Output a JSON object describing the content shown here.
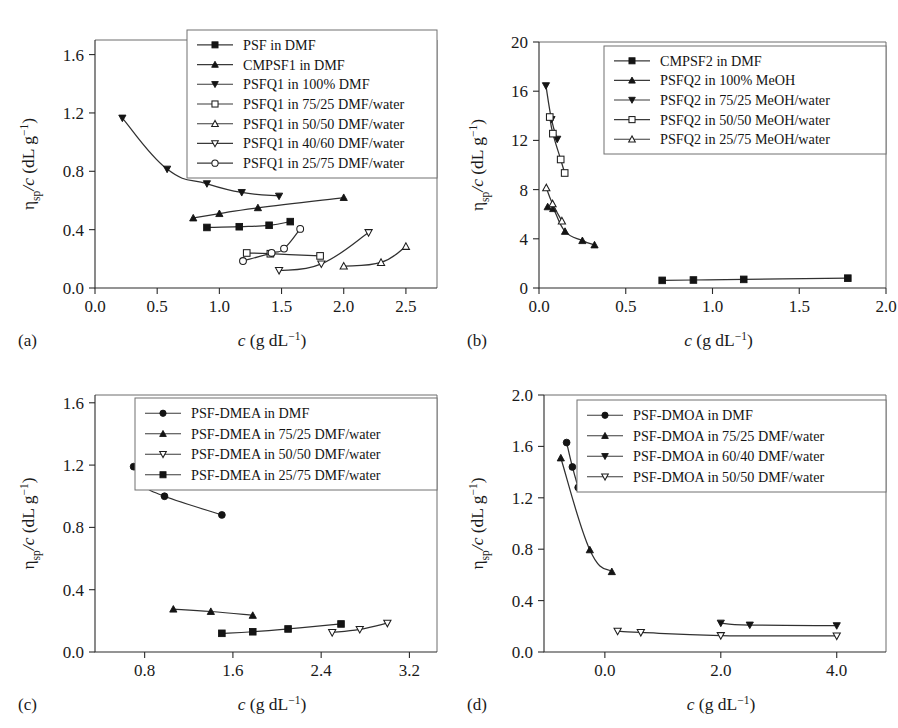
{
  "figure": {
    "panel_tags": [
      "(a)",
      "(b)",
      "(c)",
      "(d)"
    ],
    "axis_titles": {
      "x": "c (g dL−1)",
      "y": "ηsp/c (dL g−1)"
    },
    "x_symbol": "c",
    "x_units": "(g dL",
    "x_exp": "−1",
    "x_close": ")",
    "y_eta": "η",
    "y_sub": "sp",
    "y_slash_c": "/c",
    "y_units": "(dL g",
    "y_exp": "−1",
    "y_close": ")"
  },
  "chart_data": [
    {
      "id": "a",
      "type": "line",
      "panel_label": "(a)",
      "title": "",
      "xlabel": "c (g dL−1)",
      "ylabel": "ηsp/c (dL g−1)",
      "xlim": [
        0.0,
        2.75
      ],
      "ylim": [
        0.0,
        1.7
      ],
      "xticks": [
        0.0,
        0.5,
        1.0,
        1.5,
        2.0,
        2.5
      ],
      "xticklabels": [
        "0.0",
        "0.5",
        "1.0",
        "1.5",
        "2.0",
        "2.5"
      ],
      "yticks": [
        0.0,
        0.4,
        0.8,
        1.2,
        1.6
      ],
      "yticklabels": [
        "0.0",
        "0.4",
        "0.8",
        "1.2",
        "1.6"
      ],
      "grid": false,
      "legend_position": "top-right",
      "series": [
        {
          "name": "PSF in DMF",
          "marker": "square-filled",
          "x": [
            0.9,
            1.16,
            1.4,
            1.57
          ],
          "y": [
            0.415,
            0.42,
            0.43,
            0.455
          ]
        },
        {
          "name": "CMPSF1 in DMF",
          "marker": "triangle-up-filled",
          "x": [
            0.79,
            1.0,
            1.31,
            2.0
          ],
          "y": [
            0.48,
            0.51,
            0.55,
            0.62
          ]
        },
        {
          "name": "PSFQ1 in 100% DMF",
          "marker": "triangle-down-filled",
          "x": [
            0.22,
            0.58,
            0.9,
            1.18,
            1.48
          ],
          "y": [
            1.165,
            0.815,
            0.715,
            0.655,
            0.63
          ]
        },
        {
          "name": "PSFQ1 in 75/25 DMF/water",
          "marker": "square-open",
          "x": [
            1.22,
            1.41,
            1.81
          ],
          "y": [
            0.24,
            0.235,
            0.22
          ]
        },
        {
          "name": "PSFQ1 in 50/50 DMF/water",
          "marker": "triangle-up-open",
          "x": [
            2.0,
            2.3,
            2.5
          ],
          "y": [
            0.15,
            0.175,
            0.285
          ]
        },
        {
          "name": "PSFQ1 in 40/60 DMF/water",
          "marker": "triangle-down-open",
          "x": [
            1.48,
            1.82,
            2.2
          ],
          "y": [
            0.12,
            0.165,
            0.38
          ]
        },
        {
          "name": "PSFQ1 in 25/75 DMF/water",
          "marker": "circle-open",
          "x": [
            1.19,
            1.42,
            1.52,
            1.65
          ],
          "y": [
            0.185,
            0.24,
            0.27,
            0.405
          ]
        }
      ]
    },
    {
      "id": "b",
      "type": "line",
      "panel_label": "(b)",
      "title": "",
      "xlabel": "c (g dL−1)",
      "ylabel": "ηsp/c (dL g−1)",
      "xlim": [
        0.0,
        2.0
      ],
      "ylim": [
        0,
        20
      ],
      "xticks": [
        0.0,
        0.5,
        1.0,
        1.5,
        2.0
      ],
      "xticklabels": [
        "0.0",
        "0.5",
        "1.0",
        "1.5",
        "2.0"
      ],
      "yticks": [
        0,
        4,
        8,
        12,
        16,
        20
      ],
      "yticklabels": [
        "0",
        "4",
        "8",
        "12",
        "16",
        "20"
      ],
      "grid": false,
      "legend_position": "top-right",
      "series": [
        {
          "name": "CMPSF2 in DMF",
          "marker": "square-filled",
          "x": [
            0.71,
            0.89,
            1.18,
            1.78
          ],
          "y": [
            0.62,
            0.65,
            0.7,
            0.8
          ]
        },
        {
          "name": "PSFQ2 in 100% MeOH",
          "marker": "triangle-up-filled",
          "x": [
            0.05,
            0.082,
            0.15,
            0.25,
            0.32
          ],
          "y": [
            6.6,
            6.45,
            4.6,
            3.85,
            3.5
          ]
        },
        {
          "name": "PSFQ2 in 75/25 MeOH/water",
          "marker": "triangle-down-filled",
          "x": [
            0.04,
            0.072,
            0.105
          ],
          "y": [
            16.45,
            13.7,
            12.1
          ]
        },
        {
          "name": "PSFQ2 in 50/50 MeOH/water",
          "marker": "square-open",
          "x": [
            0.062,
            0.08,
            0.125,
            0.148
          ],
          "y": [
            13.9,
            12.55,
            10.45,
            9.35
          ]
        },
        {
          "name": "PSFQ2 in 25/75 MeOH/water",
          "marker": "triangle-up-open",
          "x": [
            0.042,
            0.078,
            0.132
          ],
          "y": [
            8.15,
            6.85,
            5.45
          ]
        }
      ]
    },
    {
      "id": "c",
      "type": "line",
      "panel_label": "(c)",
      "title": "",
      "xlabel": "c (g dL−1)",
      "ylabel": "ηsp/c (dL g−1)",
      "xlim": [
        0.35,
        3.45
      ],
      "ylim": [
        0.0,
        1.65
      ],
      "xticks": [
        0.8,
        1.6,
        2.4,
        3.2
      ],
      "xticklabels": [
        "0.8",
        "1.6",
        "2.4",
        "3.2"
      ],
      "yticks": [
        0.0,
        0.4,
        0.8,
        1.2,
        1.6
      ],
      "yticklabels": [
        "0.0",
        "0.4",
        "0.8",
        "1.2",
        "1.6"
      ],
      "grid": false,
      "legend_position": "top-right",
      "series": [
        {
          "name": "PSF-DMEA in DMF",
          "marker": "circle-filled",
          "x": [
            0.7,
            0.8,
            0.98,
            1.5
          ],
          "y": [
            1.19,
            1.07,
            1.0,
            0.88
          ]
        },
        {
          "name": "PSF-DMEA in 75/25 DMF/water",
          "marker": "triangle-up-filled",
          "x": [
            1.06,
            1.4,
            1.78
          ],
          "y": [
            0.275,
            0.26,
            0.235
          ]
        },
        {
          "name": "PSF-DMEA in 50/50 DMF/water",
          "marker": "triangle-down-open",
          "x": [
            2.5,
            2.75,
            3.0
          ],
          "y": [
            0.125,
            0.145,
            0.185
          ]
        },
        {
          "name": "PSF-DMEA in 25/75 DMF/water",
          "marker": "square-filled",
          "x": [
            1.5,
            1.78,
            2.1,
            2.58
          ],
          "y": [
            0.12,
            0.13,
            0.148,
            0.18
          ]
        }
      ]
    },
    {
      "id": "d",
      "type": "line",
      "panel_label": "(d)",
      "title": "",
      "xlabel": "c (g dL−1)",
      "ylabel": "ηsp/c (dL g−1)",
      "xlim": [
        -1.05,
        4.85
      ],
      "ylim": [
        0.0,
        2.0
      ],
      "xticks": [
        0.0,
        2.0,
        4.0
      ],
      "xticklabels": [
        "0.0",
        "2.0",
        "4.0"
      ],
      "yticks": [
        0.0,
        0.4,
        0.8,
        1.2,
        1.6,
        2.0
      ],
      "yticklabels": [
        "0.0",
        "0.4",
        "0.8",
        "1.2",
        "1.6",
        "2.0"
      ],
      "grid": false,
      "legend_position": "top-right",
      "series": [
        {
          "name": "PSF-DMOA in DMF",
          "marker": "circle-filled",
          "x": [
            -0.66,
            -0.56,
            -0.46
          ],
          "y": [
            1.63,
            1.44,
            1.28
          ]
        },
        {
          "name": "PSF-DMOA in 75/25 DMF/water",
          "marker": "triangle-up-filled",
          "x": [
            -0.76,
            -0.26,
            0.12
          ],
          "y": [
            1.51,
            0.795,
            0.625
          ]
        },
        {
          "name": "PSF-DMOA in 60/40 DMF/water",
          "marker": "triangle-down-filled",
          "x": [
            2.0,
            2.5,
            4.0
          ],
          "y": [
            0.225,
            0.21,
            0.205
          ]
        },
        {
          "name": "PSF-DMOA in 50/50 DMF/water",
          "marker": "triangle-down-open",
          "x": [
            0.22,
            0.62,
            2.0,
            4.0
          ],
          "y": [
            0.162,
            0.152,
            0.128,
            0.125
          ]
        }
      ]
    }
  ]
}
